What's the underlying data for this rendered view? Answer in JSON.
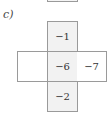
{
  "part": {
    "label": "c)"
  },
  "cross": {
    "top": "−1",
    "left": "",
    "center": "−6",
    "right": "−7",
    "bottom": "−2"
  },
  "colors": {
    "border": "#9a9a9a",
    "shaded_fill": "#f2f2f2",
    "text": "#333333"
  }
}
